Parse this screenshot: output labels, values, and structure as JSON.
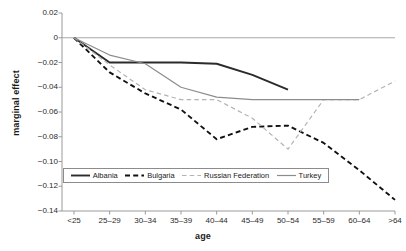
{
  "chart_data": {
    "type": "line",
    "title": "",
    "xlabel": "age",
    "ylabel": "marginal effect",
    "categories": [
      "<25",
      "25-29",
      "30-34",
      "35-39",
      "40-44",
      "45-49",
      "50-54",
      "55-59",
      "60-64",
      ">64"
    ],
    "xtick_labels": [
      "<25",
      "25–29",
      "30–34",
      "35–39",
      "40–44",
      "45–49",
      "50–54",
      "55–59",
      "60–64",
      ">64"
    ],
    "ytick_labels": [
      "0.02",
      "0",
      "−0.02",
      "−0.04",
      "−0.06",
      "−0.08",
      "−0.10",
      "−0.12",
      "−0.14"
    ],
    "ytick_values": [
      0.02,
      0,
      -0.02,
      -0.04,
      -0.06,
      -0.08,
      -0.1,
      -0.12,
      -0.14
    ],
    "ylim": [
      -0.14,
      0.02
    ],
    "grid": false,
    "zero_reference_line": 0,
    "legend_position": "inside-bottom-left",
    "series": [
      {
        "name": "Albania",
        "style": "solid",
        "color": "#2b2b2b",
        "width": 1.9,
        "values": [
          0,
          -0.02,
          -0.02,
          -0.02,
          -0.021,
          -0.03,
          -0.042,
          null,
          null,
          null
        ]
      },
      {
        "name": "Bulgaria",
        "style": "dashed",
        "color": "#111111",
        "width": 1.9,
        "values": [
          0,
          -0.028,
          -0.045,
          -0.058,
          -0.082,
          -0.072,
          -0.071,
          -0.085,
          -0.107,
          -0.131
        ]
      },
      {
        "name": "Russian Federation",
        "style": "dashed-light",
        "color": "#b3b3b3",
        "width": 1.2,
        "values": [
          0,
          -0.022,
          -0.042,
          -0.05,
          -0.05,
          -0.065,
          -0.09,
          -0.05,
          -0.05,
          -0.035
        ]
      },
      {
        "name": "Turkey",
        "style": "solid",
        "color": "#8c8c8c",
        "width": 1.2,
        "values": [
          0,
          -0.014,
          -0.021,
          -0.04,
          -0.048,
          -0.05,
          -0.05,
          -0.05,
          -0.05,
          null
        ]
      }
    ]
  },
  "legend": {
    "entries": [
      {
        "label": "Albania"
      },
      {
        "label": "Bulgaria"
      },
      {
        "label": "Russian Federation"
      },
      {
        "label": "Turkey"
      }
    ]
  },
  "colors": {
    "axis": "#9a9a9a",
    "text": "#1a1a1a",
    "albania": "#2b2b2b",
    "bulgaria": "#111111",
    "russia": "#b3b3b3",
    "turkey": "#8c8c8c"
  }
}
